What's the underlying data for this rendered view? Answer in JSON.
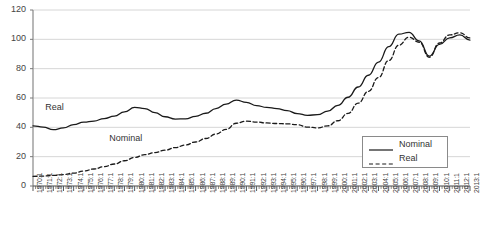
{
  "chart_data": {
    "type": "line",
    "title": "",
    "xlabel": "",
    "ylabel": "",
    "ylim": [
      0,
      120
    ],
    "yticks": [
      0,
      20,
      40,
      60,
      80,
      100,
      120
    ],
    "grid": true,
    "legend_position": "bottom-right",
    "x_tick_label_rotation": -90,
    "categories": [
      "1970:1",
      "1971:1",
      "1972:1",
      "1973:1",
      "1974:1",
      "1975:1",
      "1976:1",
      "1977:1",
      "1978:1",
      "1979:1",
      "1980:1",
      "1981:1",
      "1982:1",
      "1983:1",
      "1984:1",
      "1985:1",
      "1986:1",
      "1987:1",
      "1988:1",
      "1989:1",
      "1990:1",
      "1991:1",
      "1992:1",
      "1993:1",
      "1994:1",
      "1995:1",
      "1996:1",
      "1997:1",
      "1998:1",
      "1999:1",
      "2000:1",
      "2001:1",
      "2002:1",
      "2003:1",
      "2004:1",
      "2005:1",
      "2006:1",
      "2007:1",
      "2008:1",
      "2009:1",
      "2010:1",
      "2011:1",
      "2012:1",
      "2013:1"
    ],
    "series": [
      {
        "name": "Nominal",
        "style": "solid",
        "color": "#1a1a1a",
        "values": [
          41.0,
          40.2,
          38.4,
          39.6,
          41.8,
          43.5,
          44.3,
          46.0,
          47.6,
          50.5,
          53.6,
          52.8,
          50.0,
          47.2,
          45.6,
          45.8,
          47.5,
          49.6,
          52.8,
          55.8,
          58.6,
          57.0,
          54.8,
          53.6,
          52.8,
          51.4,
          49.4,
          48.2,
          48.6,
          51.0,
          55.0,
          60.5,
          67.5,
          75.5,
          84.5,
          95.0,
          103.5,
          104.8,
          99.0,
          88.5,
          96.5,
          101.0,
          103.0,
          99.5
        ]
      },
      {
        "name": "Real",
        "style": "dashed",
        "color": "#1a1a1a",
        "values": [
          6.6,
          6.8,
          7.2,
          7.8,
          8.8,
          10.2,
          11.6,
          13.2,
          15.0,
          17.2,
          19.5,
          21.4,
          22.8,
          24.4,
          26.2,
          28.0,
          30.0,
          32.4,
          35.4,
          38.6,
          42.8,
          44.2,
          43.6,
          43.0,
          42.6,
          42.4,
          41.8,
          40.2,
          39.6,
          41.0,
          44.5,
          49.5,
          56.5,
          64.5,
          74.0,
          85.5,
          96.0,
          101.5,
          98.0,
          87.8,
          97.5,
          103.0,
          104.5,
          101.0
        ]
      }
    ],
    "annotations": [
      {
        "text": "Real",
        "x_index": 1.2,
        "y_value": 53.0
      },
      {
        "text": "Nominal",
        "x_index": 7.5,
        "y_value": 32.0
      }
    ]
  },
  "legend": {
    "entries": [
      {
        "label": "Nominal",
        "style": "solid"
      },
      {
        "label": "Real",
        "style": "dashed"
      }
    ]
  }
}
